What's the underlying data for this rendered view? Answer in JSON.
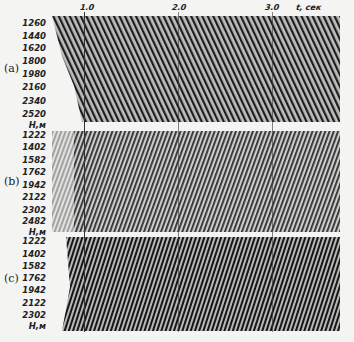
{
  "figure": {
    "time_axis": {
      "label": "t, сек",
      "ticks": [
        "1.0",
        "2.0",
        "3.0"
      ]
    },
    "panels": [
      {
        "label": "(a)",
        "depths": [
          "1260",
          "1440",
          "1620",
          "1800",
          "1980",
          "2160",
          "2340",
          "2520"
        ],
        "unit": "H,м"
      },
      {
        "label": "(b)",
        "depths": [
          "1222",
          "1402",
          "1582",
          "1762",
          "1942",
          "2122",
          "2302",
          "2482"
        ],
        "unit": "H,м"
      },
      {
        "label": "(c)",
        "depths": [
          "1222",
          "1402",
          "1582",
          "1762",
          "1942",
          "2122",
          "2302"
        ],
        "unit": "H,м"
      }
    ]
  }
}
